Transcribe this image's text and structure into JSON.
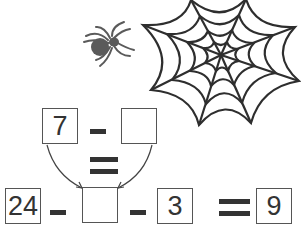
{
  "puzzle": {
    "top_row": {
      "left_value": "7",
      "operator": "minus",
      "right_value": ""
    },
    "bottom_row": {
      "first_value": "24",
      "operator1": "minus",
      "middle_value": "",
      "operator2": "minus",
      "third_value": "3",
      "equals": "equals",
      "result_value": "9"
    }
  },
  "icons": [
    "spider-icon",
    "spider-web-icon",
    "arrow-icon"
  ],
  "colors": {
    "ink": "#333333",
    "spider": "#555555",
    "box_border": "#555555"
  }
}
